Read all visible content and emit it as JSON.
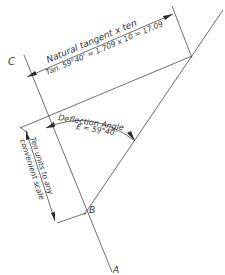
{
  "diagram": {
    "type": "geometric construction",
    "points": {
      "A": {
        "label": "A"
      },
      "B": {
        "label": "B"
      },
      "C": {
        "label": "C"
      }
    },
    "annotations": {
      "natural_tangent_title": "Natural tangent x ten",
      "natural_tangent_formula": "Tan. 59°40' = 1.709 x 10 = 17.09",
      "deflection_title": "Deflection Angle",
      "deflection_value": "E = 59°40'",
      "ten_units_line1": "Ten units to any",
      "ten_units_line2": "convenient scale"
    },
    "colors": {
      "line": "#4a4a4a",
      "text": "#333333",
      "background": "#ffffff"
    }
  }
}
